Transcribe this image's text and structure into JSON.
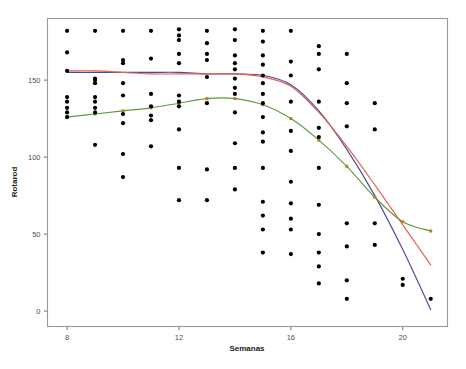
{
  "chart_data": {
    "type": "scatter",
    "title": "",
    "xlabel": "Semanas",
    "ylabel": "Rotarod",
    "xlim": [
      7.3,
      21.6
    ],
    "ylim": [
      -10,
      190
    ],
    "xticks": [
      8,
      12,
      16,
      20
    ],
    "yticks": [
      0,
      50,
      100,
      150
    ],
    "grid": false,
    "legend": "none",
    "point_color": "#000000",
    "points": [
      {
        "x": 8,
        "y": 182
      },
      {
        "x": 8,
        "y": 168
      },
      {
        "x": 8,
        "y": 156
      },
      {
        "x": 8,
        "y": 139
      },
      {
        "x": 8,
        "y": 136
      },
      {
        "x": 8,
        "y": 132
      },
      {
        "x": 8,
        "y": 129
      },
      {
        "x": 8,
        "y": 126
      },
      {
        "x": 9,
        "y": 182
      },
      {
        "x": 9,
        "y": 151
      },
      {
        "x": 9,
        "y": 150
      },
      {
        "x": 9,
        "y": 148
      },
      {
        "x": 9,
        "y": 139
      },
      {
        "x": 9,
        "y": 136
      },
      {
        "x": 9,
        "y": 132
      },
      {
        "x": 9,
        "y": 129
      },
      {
        "x": 9,
        "y": 108
      },
      {
        "x": 10,
        "y": 182
      },
      {
        "x": 10,
        "y": 163
      },
      {
        "x": 10,
        "y": 161
      },
      {
        "x": 10,
        "y": 148
      },
      {
        "x": 10,
        "y": 140
      },
      {
        "x": 10,
        "y": 128
      },
      {
        "x": 10,
        "y": 122
      },
      {
        "x": 10,
        "y": 102
      },
      {
        "x": 10,
        "y": 87
      },
      {
        "x": 11,
        "y": 182
      },
      {
        "x": 11,
        "y": 164
      },
      {
        "x": 11,
        "y": 141
      },
      {
        "x": 11,
        "y": 133
      },
      {
        "x": 11,
        "y": 127
      },
      {
        "x": 11,
        "y": 124
      },
      {
        "x": 11,
        "y": 107
      },
      {
        "x": 12,
        "y": 183
      },
      {
        "x": 12,
        "y": 179
      },
      {
        "x": 12,
        "y": 176
      },
      {
        "x": 12,
        "y": 167
      },
      {
        "x": 12,
        "y": 161
      },
      {
        "x": 12,
        "y": 140
      },
      {
        "x": 12,
        "y": 136
      },
      {
        "x": 12,
        "y": 133
      },
      {
        "x": 12,
        "y": 118
      },
      {
        "x": 12,
        "y": 93
      },
      {
        "x": 12,
        "y": 72
      },
      {
        "x": 13,
        "y": 182
      },
      {
        "x": 13,
        "y": 174
      },
      {
        "x": 13,
        "y": 167
      },
      {
        "x": 13,
        "y": 163
      },
      {
        "x": 13,
        "y": 152
      },
      {
        "x": 13,
        "y": 135
      },
      {
        "x": 13,
        "y": 92
      },
      {
        "x": 13,
        "y": 72
      },
      {
        "x": 14,
        "y": 183
      },
      {
        "x": 14,
        "y": 176
      },
      {
        "x": 14,
        "y": 166
      },
      {
        "x": 14,
        "y": 161
      },
      {
        "x": 14,
        "y": 157
      },
      {
        "x": 14,
        "y": 151
      },
      {
        "x": 14,
        "y": 145
      },
      {
        "x": 14,
        "y": 141
      },
      {
        "x": 14,
        "y": 129
      },
      {
        "x": 14,
        "y": 109
      },
      {
        "x": 14,
        "y": 93
      },
      {
        "x": 14,
        "y": 79
      },
      {
        "x": 15,
        "y": 182
      },
      {
        "x": 15,
        "y": 175
      },
      {
        "x": 15,
        "y": 166
      },
      {
        "x": 15,
        "y": 160
      },
      {
        "x": 15,
        "y": 153
      },
      {
        "x": 15,
        "y": 148
      },
      {
        "x": 15,
        "y": 141
      },
      {
        "x": 15,
        "y": 135
      },
      {
        "x": 15,
        "y": 126
      },
      {
        "x": 15,
        "y": 116
      },
      {
        "x": 15,
        "y": 110
      },
      {
        "x": 15,
        "y": 93
      },
      {
        "x": 15,
        "y": 71
      },
      {
        "x": 15,
        "y": 62
      },
      {
        "x": 15,
        "y": 53
      },
      {
        "x": 15,
        "y": 38
      },
      {
        "x": 16,
        "y": 182
      },
      {
        "x": 16,
        "y": 162
      },
      {
        "x": 16,
        "y": 153
      },
      {
        "x": 16,
        "y": 136
      },
      {
        "x": 16,
        "y": 117
      },
      {
        "x": 16,
        "y": 104
      },
      {
        "x": 16,
        "y": 84
      },
      {
        "x": 16,
        "y": 70
      },
      {
        "x": 16,
        "y": 60
      },
      {
        "x": 16,
        "y": 53
      },
      {
        "x": 16,
        "y": 37
      },
      {
        "x": 17,
        "y": 172
      },
      {
        "x": 17,
        "y": 167
      },
      {
        "x": 17,
        "y": 157
      },
      {
        "x": 17,
        "y": 136
      },
      {
        "x": 17,
        "y": 119
      },
      {
        "x": 17,
        "y": 113
      },
      {
        "x": 17,
        "y": 93
      },
      {
        "x": 17,
        "y": 69
      },
      {
        "x": 17,
        "y": 50
      },
      {
        "x": 17,
        "y": 38
      },
      {
        "x": 17,
        "y": 29
      },
      {
        "x": 17,
        "y": 18
      },
      {
        "x": 18,
        "y": 167
      },
      {
        "x": 18,
        "y": 148
      },
      {
        "x": 18,
        "y": 135
      },
      {
        "x": 18,
        "y": 120
      },
      {
        "x": 18,
        "y": 57
      },
      {
        "x": 18,
        "y": 42
      },
      {
        "x": 18,
        "y": 20
      },
      {
        "x": 18,
        "y": 8
      },
      {
        "x": 19,
        "y": 135
      },
      {
        "x": 19,
        "y": 118
      },
      {
        "x": 19,
        "y": 57
      },
      {
        "x": 19,
        "y": 43
      },
      {
        "x": 20,
        "y": 21
      },
      {
        "x": 20,
        "y": 17
      },
      {
        "x": 21,
        "y": 8
      }
    ],
    "series": [
      {
        "name": "fit-blue",
        "color": "#4a4a9c",
        "type": "line",
        "x": [
          8,
          9,
          10,
          11,
          12,
          13,
          14,
          15,
          16,
          17,
          18,
          19,
          20,
          21
        ],
        "y": [
          155,
          155,
          155,
          155,
          155,
          154,
          154,
          153,
          147,
          130,
          105,
          75,
          40,
          1
        ]
      },
      {
        "name": "fit-red",
        "color": "#e8604c",
        "type": "line",
        "x": [
          8,
          9,
          10,
          11,
          12,
          13,
          14,
          15,
          16,
          17,
          18,
          19,
          20,
          21
        ],
        "y": [
          156,
          156,
          155,
          154,
          154,
          154,
          154,
          152,
          146,
          129,
          107,
          82,
          56,
          30
        ]
      },
      {
        "name": "fit-green",
        "color": "#5b9c3e",
        "type": "line",
        "marker_color": "#b08030",
        "x": [
          8,
          9,
          10,
          11,
          12,
          13,
          14,
          15,
          16,
          17,
          18,
          19,
          20,
          21
        ],
        "y": [
          126,
          128,
          130,
          132,
          135,
          138,
          138,
          134,
          125,
          111,
          94,
          74,
          58,
          52
        ]
      }
    ]
  },
  "axes": {
    "x_title": "Semanas",
    "y_title": "Rotarod",
    "x_tick_labels": [
      "8",
      "12",
      "16",
      "20"
    ],
    "y_tick_labels": [
      "0",
      "50",
      "100",
      "150"
    ]
  }
}
